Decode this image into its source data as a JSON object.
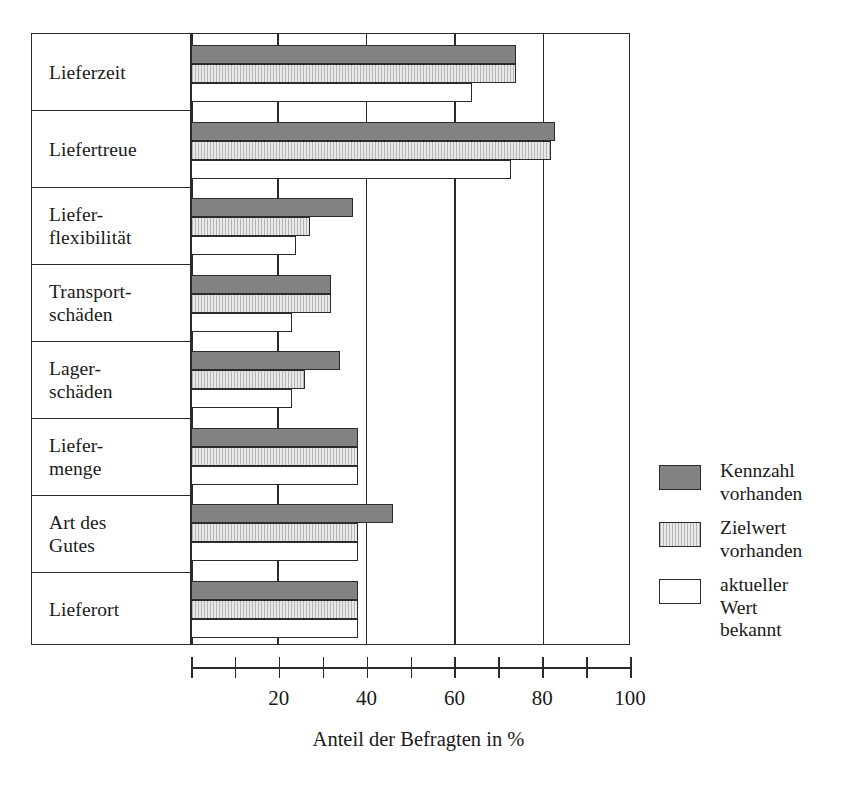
{
  "chart_data": {
    "type": "bar",
    "orientation": "horizontal",
    "title": "",
    "xlabel": "Anteil der Befragten in %",
    "ylabel": "",
    "xlim": [
      0,
      100
    ],
    "xticks": [
      0,
      10,
      20,
      30,
      40,
      50,
      60,
      70,
      80,
      90,
      100
    ],
    "xtick_labels": [
      "",
      "",
      "20",
      "",
      "40",
      "",
      "60",
      "",
      "80",
      "",
      "100"
    ],
    "grid": "vertical gridlines at 20, 40, 60, 80",
    "legend_position": "right",
    "categories": [
      "Lieferzeit",
      "Liefer-\nflexibilität",
      "Liefertreue",
      "Transport-\nschäden",
      "Lager-\nschäden",
      "Liefer-\nmenge",
      "Art des\nGutes",
      "Lieferort"
    ],
    "category_order": [
      "Lieferzeit",
      "Liefertreue",
      "Liefer-\nflexibilität",
      "Transport-\nschäden",
      "Lager-\nschäden",
      "Liefer-\nmenge",
      "Art des\nGutes",
      "Lieferort"
    ],
    "series": [
      {
        "name": "Kennzahl\nvorhanden",
        "color": "#828282",
        "values": [
          74,
          83,
          37,
          32,
          34,
          38,
          46,
          38
        ]
      },
      {
        "name": "Zielwert\nvorhanden",
        "color": "#e8e8e8",
        "values": [
          74,
          82,
          27,
          32,
          26,
          38,
          38,
          38
        ]
      },
      {
        "name": "aktueller Wert\nbekannt",
        "color": "#ffffff",
        "values": [
          64,
          73,
          24,
          23,
          23,
          38,
          38,
          38
        ]
      }
    ]
  },
  "axis": {
    "tick_labels": [
      {
        "value": 20,
        "text": "20"
      },
      {
        "value": 40,
        "text": "40"
      },
      {
        "value": 60,
        "text": "60"
      },
      {
        "value": 80,
        "text": "80"
      },
      {
        "value": 100,
        "text": "100"
      }
    ],
    "title": "Anteil der Befragten in %"
  },
  "legend": {
    "items": [
      {
        "label": "Kennzahl\nvorhanden",
        "swatch": "dark-gray"
      },
      {
        "label": "Zielwert\nvorhanden",
        "swatch": "light-gray-hatched"
      },
      {
        "label": "aktueller Wert\nbekannt",
        "swatch": "white"
      }
    ]
  },
  "colors": {
    "series_dark": "#828282",
    "series_light": "#e8e8e8",
    "series_white": "#ffffff",
    "line": "#2b2b2b",
    "background": "#ffffff"
  }
}
